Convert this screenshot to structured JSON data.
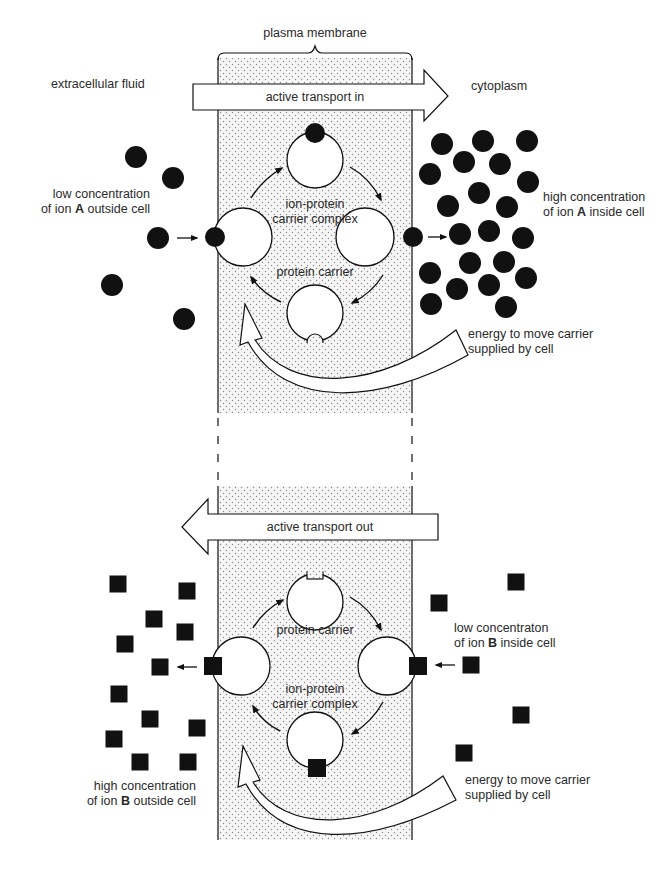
{
  "colors": {
    "ink": "#111111",
    "membrane_fill": "#f4f4f4",
    "dot": "#8a8a8a",
    "background": "#ffffff"
  },
  "membrane": {
    "label": "plasma membrane",
    "left_x": 218,
    "right_x": 412,
    "top_section": [
      58,
      413
    ],
    "bottom_section": [
      486,
      840
    ],
    "gap_dashed": [
      413,
      486
    ]
  },
  "labels": {
    "extracellular": "extracellular fluid",
    "cytoplasm": "cytoplasm",
    "transport_in": "active transport in",
    "transport_out": "active transport out",
    "top": {
      "low_conc_line1": "low concentration",
      "low_conc_line2_pre": "of ion ",
      "low_conc_ion": "A",
      "low_conc_line2_post": " outside cell",
      "high_conc_line1": "high concentration",
      "high_conc_line2_pre": "of ion ",
      "high_conc_ion": "A",
      "high_conc_line2_post": " inside cell",
      "complex": [
        "ion-protein",
        "carrier complex"
      ],
      "carrier": "protein carrier",
      "energy": [
        "energy to move carrier",
        "supplied by cell"
      ]
    },
    "bottom": {
      "low_conc_line1": "low concentraton",
      "low_conc_line2_pre": "of ion ",
      "low_conc_ion": "B",
      "low_conc_line2_post": " inside cell",
      "high_conc_line1": "high concentration",
      "high_conc_line2_pre": "of ion ",
      "high_conc_ion": "B",
      "high_conc_line2_post": " outside cell",
      "carrier": "protein carrier",
      "complex": [
        "ion-protein",
        "carrier complex"
      ],
      "energy": [
        "energy to move carrier",
        "supplied by cell"
      ]
    }
  },
  "ions_A_outside": [
    [
      136,
      157
    ],
    [
      173,
      178
    ],
    [
      158,
      238
    ],
    [
      112,
      285
    ],
    [
      184,
      319
    ]
  ],
  "ions_A_inside": [
    [
      442,
      144
    ],
    [
      483,
      141
    ],
    [
      527,
      141
    ],
    [
      464,
      162
    ],
    [
      500,
      164
    ],
    [
      430,
      174
    ],
    [
      528,
      182
    ],
    [
      479,
      193
    ],
    [
      448,
      206
    ],
    [
      507,
      207
    ],
    [
      460,
      234
    ],
    [
      489,
      231
    ],
    [
      523,
      238
    ],
    [
      470,
      263
    ],
    [
      504,
      262
    ],
    [
      430,
      273
    ],
    [
      457,
      289
    ],
    [
      489,
      285
    ],
    [
      526,
      278
    ],
    [
      431,
      304
    ],
    [
      506,
      307
    ]
  ],
  "ions_B_outside": [
    [
      118,
      584
    ],
    [
      187,
      591
    ],
    [
      154,
      619
    ],
    [
      185,
      632
    ],
    [
      125,
      644
    ],
    [
      160,
      667
    ],
    [
      119,
      694
    ],
    [
      150,
      719
    ],
    [
      197,
      728
    ],
    [
      114,
      739
    ],
    [
      140,
      762
    ],
    [
      188,
      762
    ]
  ],
  "ions_B_inside": [
    [
      516,
      582
    ],
    [
      439,
      603
    ],
    [
      471,
      665
    ],
    [
      521,
      715
    ],
    [
      464,
      753
    ]
  ],
  "carriers_top": [
    {
      "id": "top",
      "cx": 315,
      "cy": 160,
      "r": 28,
      "ion": [
        315,
        133
      ]
    },
    {
      "id": "left",
      "cx": 243,
      "cy": 237,
      "r": 29,
      "ion": [
        215,
        237
      ]
    },
    {
      "id": "right",
      "cx": 365,
      "cy": 237,
      "r": 29,
      "ion": [
        413,
        237
      ]
    },
    {
      "id": "bottom",
      "cx": 315,
      "cy": 313,
      "r": 28,
      "notch": "round"
    }
  ],
  "carriers_bottom": [
    {
      "id": "top",
      "cx": 315,
      "cy": 602,
      "r": 28,
      "notch": "square"
    },
    {
      "id": "left",
      "cx": 241,
      "cy": 666,
      "r": 29,
      "ion": [
        213,
        666
      ]
    },
    {
      "id": "right",
      "cx": 387,
      "cy": 666,
      "r": 29,
      "ion": [
        418,
        666
      ]
    },
    {
      "id": "bottom",
      "cx": 315,
      "cy": 740,
      "r": 28,
      "ion": [
        317,
        768
      ]
    }
  ]
}
